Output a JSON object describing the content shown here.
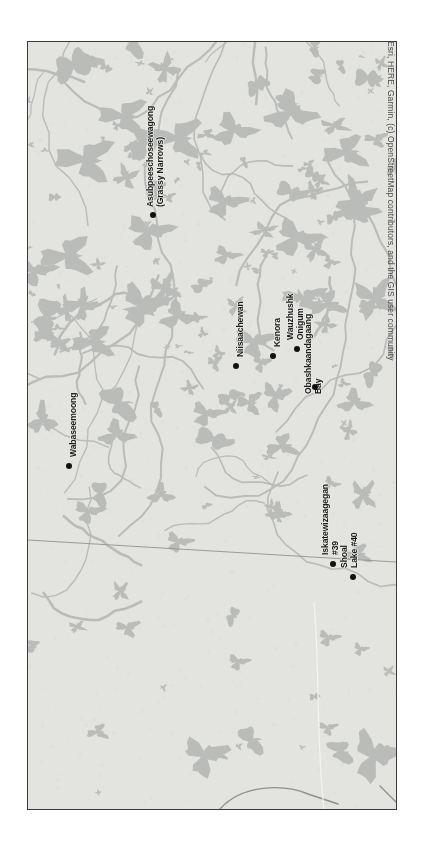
{
  "map": {
    "orientation": "rotated-90-clockwise",
    "basemap_colors": {
      "land": "#e3e3e0",
      "water": "#b9bcb8",
      "frame_border": "#3a3a3a",
      "boundary_line": "#9a9a96",
      "marker": "#111111",
      "label_text": "#1c1c1c"
    },
    "attribution": "Esri, HERE, Garmin, (c) OpenStreetMap contributors, and the GIS user community",
    "places": [
      {
        "id": "asubpeeschoseewagong",
        "name_lines": [
          "Asubpeeschoseewagong",
          "(Grassy Narrows)"
        ],
        "label_x": 146,
        "label_y": 207,
        "dot_x": 150,
        "dot_y": 212
      },
      {
        "id": "wabaseemoong",
        "name_lines": [
          "Wabaseemoong"
        ],
        "label_x": 69,
        "label_y": 457,
        "dot_x": 66,
        "dot_y": 463
      },
      {
        "id": "niisaachewan",
        "name_lines": [
          "Niisaachewan"
        ],
        "label_x": 236,
        "label_y": 357,
        "dot_x": 233,
        "dot_y": 363
      },
      {
        "id": "kenora",
        "name_lines": [
          "Kenora"
        ],
        "label_x": 273,
        "label_y": 347,
        "dot_x": 270,
        "dot_y": 353
      },
      {
        "id": "wauzhushk-onigum",
        "name_lines": [
          "Wauzhushk",
          "Onigum"
        ],
        "label_x": 286,
        "label_y": 340,
        "dot_x": 294,
        "dot_y": 346
      },
      {
        "id": "obashkaandagaang-bay",
        "name_lines": [
          "Obashkaandagaang",
          "Bay"
        ],
        "label_x": 304,
        "label_y": 394,
        "dot_x": 312,
        "dot_y": 384
      },
      {
        "id": "iskatewizaagegan-39",
        "name_lines": [
          "Iskatewizaagegan",
          "#39"
        ],
        "label_x": 321,
        "label_y": 555,
        "dot_x": 330,
        "dot_y": 561
      },
      {
        "id": "shoal-lake-40",
        "name_lines": [
          "Shoal",
          "Lake #40"
        ],
        "label_x": 340,
        "label_y": 568,
        "dot_x": 350,
        "dot_y": 574
      }
    ]
  }
}
